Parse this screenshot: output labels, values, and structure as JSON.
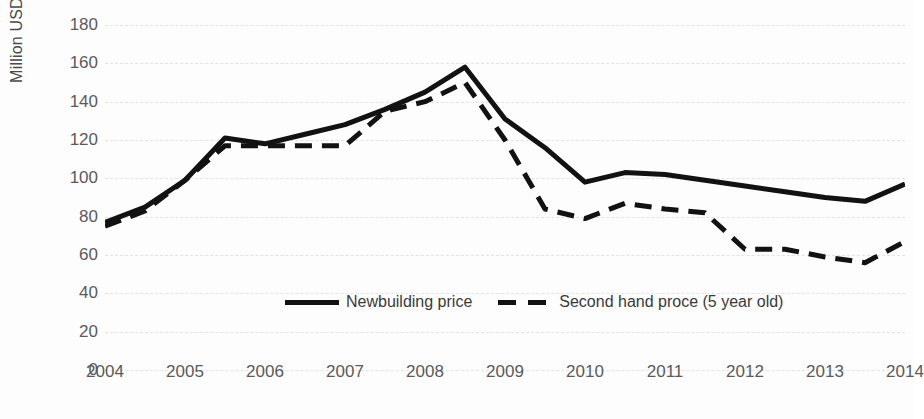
{
  "chart_data": {
    "type": "line",
    "title": "",
    "xlabel": "",
    "ylabel": "Million USD",
    "ylim": [
      0,
      180
    ],
    "ytick_step": 20,
    "yticks": [
      180,
      160,
      140,
      120,
      100,
      80,
      60,
      40,
      20,
      0
    ],
    "xticks": [
      "2004",
      "2005",
      "2006",
      "2007",
      "2008",
      "2009",
      "2010",
      "2011",
      "2012",
      "2013",
      "2014"
    ],
    "xlim": [
      2004,
      2014
    ],
    "grid": "horizontal-dashed",
    "legend_position": "inside-bottom-center",
    "x": [
      2004.0,
      2004.5,
      2005.0,
      2005.5,
      2006.0,
      2006.5,
      2007.0,
      2007.5,
      2008.0,
      2008.5,
      2009.0,
      2009.5,
      2010.0,
      2010.5,
      2011.0,
      2011.5,
      2012.0,
      2012.5,
      2013.0,
      2013.5,
      2014.0
    ],
    "series": [
      {
        "name": "Newbuilding price",
        "style": "solid",
        "color": "#121212",
        "values": [
          77,
          85,
          99,
          121,
          118,
          123,
          128,
          136,
          145,
          158,
          131,
          116,
          98,
          103,
          102,
          99,
          96,
          93,
          90,
          88,
          97
        ]
      },
      {
        "name": "Second hand proce (5 year old)",
        "style": "dashed",
        "color": "#121212",
        "values": [
          75,
          83,
          99,
          117,
          117,
          117,
          117,
          135,
          140,
          150,
          120,
          84,
          79,
          87,
          84,
          82,
          63,
          63,
          59,
          56,
          67
        ]
      }
    ],
    "legend": [
      {
        "label": "Newbuilding price",
        "style": "solid"
      },
      {
        "label": "Second hand proce (5 year old)",
        "style": "dashed"
      }
    ]
  }
}
